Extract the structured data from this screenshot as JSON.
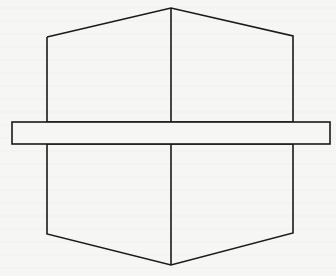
{
  "diagram": {
    "type": "geometric-line-drawing",
    "stroke_color": "#1a1a1a",
    "background_color": "#f6f6f4",
    "stroke_width": 1.6,
    "shapes": {
      "upper_pentagon": {
        "points": [
          [
            47,
            37
          ],
          [
            171,
            8
          ],
          [
            293,
            36
          ],
          [
            293,
            122
          ],
          [
            47,
            122
          ]
        ]
      },
      "lower_pentagon": {
        "points": [
          [
            47,
            144
          ],
          [
            293,
            144
          ],
          [
            293,
            233
          ],
          [
            171,
            265
          ],
          [
            47,
            234
          ]
        ]
      },
      "horizontal_band": {
        "x": 12,
        "y": 122,
        "width": 318,
        "height": 22
      },
      "upper_center_line": {
        "x1": 171,
        "y1": 8,
        "x2": 171,
        "y2": 122
      },
      "lower_center_line": {
        "x1": 171,
        "y1": 144,
        "x2": 171,
        "y2": 265
      }
    }
  }
}
